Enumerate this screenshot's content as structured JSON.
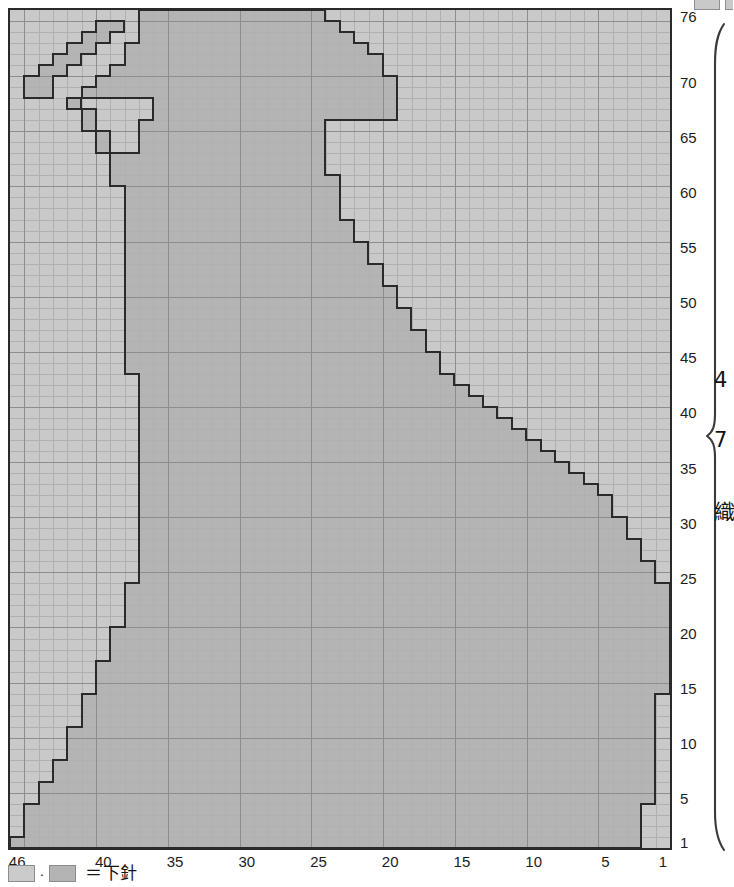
{
  "chart_data": {
    "type": "heatmap",
    "title": "",
    "xlabel": "",
    "ylabel": "",
    "grid": {
      "columns": 46,
      "rows": 76
    },
    "x_direction": "right-to-left",
    "y_direction": "bottom-to-top",
    "column_ticks": [
      46,
      40,
      35,
      30,
      25,
      20,
      15,
      10,
      5,
      1
    ],
    "row_ticks": [
      1,
      5,
      10,
      15,
      20,
      25,
      30,
      35,
      40,
      45,
      50,
      55,
      60,
      65,
      70,
      76
    ],
    "xlim": [
      46,
      1
    ],
    "ylim": [
      1,
      76
    ],
    "grid_on": true,
    "legend_position": "bottom-left",
    "colors": {
      "background_cell": "#c9c9c9",
      "motif_cell": "#b4b4b4",
      "outline": "#2a2a2a",
      "gridline_minor": "#b0b0b0",
      "gridline_major": "#8d8d8d",
      "border": "#2a2a2a",
      "text": "#141414"
    },
    "motif_row_spans": [
      {
        "row": 1,
        "start": 46,
        "end": 3
      },
      {
        "row": 2,
        "start": 45,
        "end": 3
      },
      {
        "row": 3,
        "start": 45,
        "end": 3
      },
      {
        "row": 4,
        "start": 45,
        "end": 3
      },
      {
        "row": 5,
        "start": 44,
        "end": 2
      },
      {
        "row": 6,
        "start": 44,
        "end": 2
      },
      {
        "row": 7,
        "start": 43,
        "end": 2
      },
      {
        "row": 8,
        "start": 43,
        "end": 2
      },
      {
        "row": 9,
        "start": 42,
        "end": 2
      },
      {
        "row": 10,
        "start": 42,
        "end": 2
      },
      {
        "row": 11,
        "start": 42,
        "end": 2
      },
      {
        "row": 12,
        "start": 41,
        "end": 2
      },
      {
        "row": 13,
        "start": 41,
        "end": 2
      },
      {
        "row": 14,
        "start": 41,
        "end": 2
      },
      {
        "row": 15,
        "start": 40,
        "end": 1
      },
      {
        "row": 16,
        "start": 40,
        "end": 1
      },
      {
        "row": 17,
        "start": 40,
        "end": 1
      },
      {
        "row": 18,
        "start": 39,
        "end": 1
      },
      {
        "row": 19,
        "start": 39,
        "end": 1
      },
      {
        "row": 20,
        "start": 39,
        "end": 1
      },
      {
        "row": 21,
        "start": 38,
        "end": 1
      },
      {
        "row": 22,
        "start": 38,
        "end": 1
      },
      {
        "row": 23,
        "start": 38,
        "end": 1
      },
      {
        "row": 24,
        "start": 38,
        "end": 1
      },
      {
        "row": 25,
        "start": 37,
        "end": 2
      },
      {
        "row": 26,
        "start": 37,
        "end": 2
      },
      {
        "row": 27,
        "start": 37,
        "end": 3
      },
      {
        "row": 28,
        "start": 37,
        "end": 3
      },
      {
        "row": 29,
        "start": 37,
        "end": 4
      },
      {
        "row": 30,
        "start": 37,
        "end": 4
      },
      {
        "row": 31,
        "start": 37,
        "end": 5
      },
      {
        "row": 32,
        "start": 37,
        "end": 5
      },
      {
        "row": 33,
        "start": 37,
        "end": 6
      },
      {
        "row": 34,
        "start": 37,
        "end": 7
      },
      {
        "row": 35,
        "start": 37,
        "end": 8
      },
      {
        "row": 36,
        "start": 37,
        "end": 9
      },
      {
        "row": 37,
        "start": 37,
        "end": 10
      },
      {
        "row": 38,
        "start": 37,
        "end": 11
      },
      {
        "row": 39,
        "start": 37,
        "end": 12
      },
      {
        "row": 40,
        "start": 37,
        "end": 13
      },
      {
        "row": 41,
        "start": 37,
        "end": 14
      },
      {
        "row": 42,
        "start": 37,
        "end": 15
      },
      {
        "row": 43,
        "start": 37,
        "end": 16
      },
      {
        "row": 44,
        "start": 38,
        "end": 17
      },
      {
        "row": 45,
        "start": 38,
        "end": 17
      },
      {
        "row": 46,
        "start": 38,
        "end": 18
      },
      {
        "row": 47,
        "start": 38,
        "end": 18
      },
      {
        "row": 48,
        "start": 38,
        "end": 19
      },
      {
        "row": 49,
        "start": 38,
        "end": 19
      },
      {
        "row": 50,
        "start": 38,
        "end": 20
      },
      {
        "row": 51,
        "start": 38,
        "end": 20
      },
      {
        "row": 52,
        "start": 38,
        "end": 21
      },
      {
        "row": 53,
        "start": 38,
        "end": 21
      },
      {
        "row": 54,
        "start": 38,
        "end": 22
      },
      {
        "row": 55,
        "start": 38,
        "end": 22
      },
      {
        "row": 56,
        "start": 38,
        "end": 23
      },
      {
        "row": 57,
        "start": 38,
        "end": 23
      },
      {
        "row": 58,
        "start": 38,
        "end": 24
      },
      {
        "row": 59,
        "start": 38,
        "end": 24
      },
      {
        "row": 60,
        "start": 38,
        "end": 24
      },
      {
        "row": 61,
        "start": 39,
        "end": 24
      },
      {
        "row": 62,
        "start": 39,
        "end": 25
      },
      {
        "row": 63,
        "start": 39,
        "end": 25
      },
      {
        "row": 64,
        "start": 40,
        "end": 25
      },
      {
        "row": 65,
        "start": 40,
        "end": 25
      },
      {
        "row": 66,
        "start": 41,
        "end": 25
      },
      {
        "row": 67,
        "start": 41,
        "end": 20
      },
      {
        "row": 68,
        "start": 42,
        "end": 20
      },
      {
        "row": 69,
        "start": 45,
        "end": 20
      },
      {
        "row": 70,
        "start": 45,
        "end": 20
      },
      {
        "row": 71,
        "start": 44,
        "end": 21
      },
      {
        "row": 72,
        "start": 43,
        "end": 21
      },
      {
        "row": 73,
        "start": 42,
        "end": 22
      },
      {
        "row": 74,
        "start": 41,
        "end": 23
      },
      {
        "row": 75,
        "start": 40,
        "end": 24
      },
      {
        "row": 76,
        "start": 37,
        "end": 25
      }
    ],
    "motif_holes": [
      {
        "row": 69,
        "start": 43,
        "end": 42
      },
      {
        "row": 68,
        "start": 41,
        "end": 37
      },
      {
        "row": 67,
        "start": 40,
        "end": 37
      },
      {
        "row": 66,
        "start": 40,
        "end": 38
      },
      {
        "row": 65,
        "start": 39,
        "end": 38
      },
      {
        "row": 64,
        "start": 39,
        "end": 38
      },
      {
        "row": 70,
        "start": 43,
        "end": 41
      },
      {
        "row": 71,
        "start": 42,
        "end": 40
      },
      {
        "row": 72,
        "start": 41,
        "end": 39
      },
      {
        "row": 73,
        "start": 40,
        "end": 39
      },
      {
        "row": 74,
        "start": 39,
        "end": 38
      },
      {
        "row": 75,
        "start": 38,
        "end": 38
      }
    ]
  },
  "chart": {
    "name": "knitting-chart",
    "columns": 46,
    "rows": 76,
    "column_ticks": [
      {
        "value": 46,
        "label": "46"
      },
      {
        "value": 40,
        "label": "40"
      },
      {
        "value": 35,
        "label": "35"
      },
      {
        "value": 30,
        "label": "30"
      },
      {
        "value": 25,
        "label": "25"
      },
      {
        "value": 20,
        "label": "20"
      },
      {
        "value": 15,
        "label": "15"
      },
      {
        "value": 10,
        "label": "10"
      },
      {
        "value": 5,
        "label": "5"
      },
      {
        "value": 1,
        "label": "1"
      }
    ],
    "row_ticks": [
      {
        "value": 76,
        "label": "76"
      },
      {
        "value": 70,
        "label": "70"
      },
      {
        "value": 65,
        "label": "65"
      },
      {
        "value": 60,
        "label": "60"
      },
      {
        "value": 55,
        "label": "55"
      },
      {
        "value": 50,
        "label": "50"
      },
      {
        "value": 45,
        "label": "45"
      },
      {
        "value": 40,
        "label": "40"
      },
      {
        "value": 35,
        "label": "35"
      },
      {
        "value": 30,
        "label": "30"
      },
      {
        "value": 25,
        "label": "25"
      },
      {
        "value": 20,
        "label": "20"
      },
      {
        "value": 15,
        "label": "15"
      },
      {
        "value": 10,
        "label": "10"
      },
      {
        "value": 5,
        "label": "5"
      },
      {
        "value": 1,
        "label": "1"
      }
    ]
  },
  "legend": {
    "swatch_light_name": "background-swatch",
    "swatch_dark_name": "motif-swatch",
    "separator": "·",
    "equals_text": "＝下針"
  },
  "side_notes": {
    "note_a": "4",
    "note_b": "7",
    "note_c": "織"
  }
}
